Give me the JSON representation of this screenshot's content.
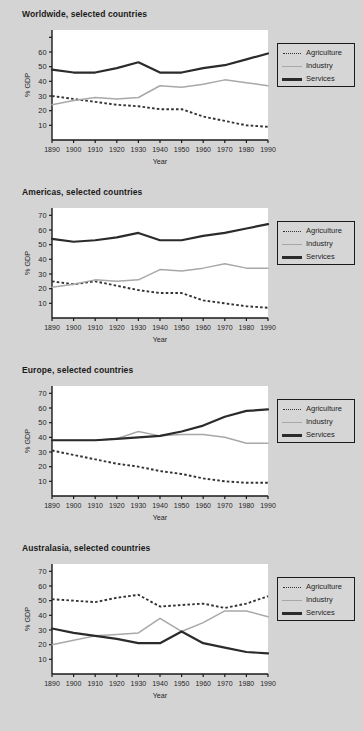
{
  "background_color": "#d4d4d4",
  "legend": {
    "items": [
      {
        "label": "Agriculture",
        "style": "dotted",
        "color": "#333333"
      },
      {
        "label": "Industry",
        "style": "thin-solid",
        "color": "#a8a8a8"
      },
      {
        "label": "Services",
        "style": "thick-solid",
        "color": "#2b2b2b"
      }
    ]
  },
  "chart_data": [
    {
      "type": "line",
      "title": "Worldwide, selected countries",
      "xlabel": "Year",
      "ylabel": "% GDP",
      "x": [
        1890,
        1900,
        1910,
        1920,
        1930,
        1940,
        1950,
        1960,
        1970,
        1980,
        1990
      ],
      "xlim": [
        1890,
        1990
      ],
      "ylim": [
        0,
        75
      ],
      "yticks": [
        10,
        20,
        30,
        40,
        50,
        60
      ],
      "ytick_labels": [
        "10",
        "20",
        "30",
        "40",
        "50",
        "60"
      ],
      "xtick_labels": [
        "1890",
        "1900",
        "1910",
        "1920",
        "1930",
        "1940",
        "1950",
        "1960",
        "1970",
        "1980",
        "1990"
      ],
      "grid": false,
      "legend_position": "right",
      "series": [
        {
          "name": "Agriculture",
          "style": "dotted",
          "color": "#333333",
          "values": [
            30,
            28,
            26,
            24,
            23,
            21,
            21,
            16,
            13,
            10,
            9
          ]
        },
        {
          "name": "Industry",
          "style": "thin-solid",
          "color": "#a8a8a8",
          "values": [
            24,
            27,
            29,
            28,
            29,
            37,
            36,
            38,
            41,
            39,
            37
          ]
        },
        {
          "name": "Services",
          "style": "thick-solid",
          "color": "#2b2b2b",
          "values": [
            48,
            46,
            46,
            49,
            53,
            46,
            46,
            49,
            51,
            55,
            59
          ]
        }
      ]
    },
    {
      "type": "line",
      "title": "Americas, selected countries",
      "xlabel": "Year",
      "ylabel": "% GDP",
      "x": [
        1890,
        1900,
        1910,
        1920,
        1930,
        1940,
        1950,
        1960,
        1970,
        1980,
        1990
      ],
      "xlim": [
        1890,
        1990
      ],
      "ylim": [
        0,
        75
      ],
      "yticks": [
        10,
        20,
        30,
        40,
        50,
        60,
        70
      ],
      "ytick_labels": [
        "10",
        "20",
        "30",
        "40",
        "50",
        "60",
        "70"
      ],
      "xtick_labels": [
        "1890",
        "1900",
        "1910",
        "1920",
        "1930",
        "1940",
        "1950",
        "1960",
        "1970",
        "1980",
        "1990"
      ],
      "grid": false,
      "legend_position": "right",
      "series": [
        {
          "name": "Agriculture",
          "style": "dotted",
          "color": "#333333",
          "values": [
            25,
            23,
            25,
            22,
            19,
            17,
            17,
            12,
            10,
            8,
            7
          ]
        },
        {
          "name": "Industry",
          "style": "thin-solid",
          "color": "#a8a8a8",
          "values": [
            21,
            23,
            26,
            25,
            26,
            33,
            32,
            34,
            37,
            34,
            34
          ]
        },
        {
          "name": "Services",
          "style": "thick-solid",
          "color": "#2b2b2b",
          "values": [
            54,
            52,
            53,
            55,
            58,
            53,
            53,
            56,
            58,
            61,
            64
          ]
        }
      ]
    },
    {
      "type": "line",
      "title": "Europe, selected countries",
      "xlabel": "Year",
      "ylabel": "% GDP",
      "x": [
        1890,
        1900,
        1910,
        1920,
        1930,
        1940,
        1950,
        1960,
        1970,
        1980,
        1990
      ],
      "xlim": [
        1890,
        1990
      ],
      "ylim": [
        0,
        75
      ],
      "yticks": [
        10,
        20,
        30,
        40,
        50,
        60,
        70
      ],
      "ytick_labels": [
        "10",
        "20",
        "30",
        "40",
        "50",
        "60",
        "70"
      ],
      "xtick_labels": [
        "1890",
        "1900",
        "1910",
        "1920",
        "1930",
        "1940",
        "1950",
        "1960",
        "1970",
        "1980",
        "1990"
      ],
      "grid": false,
      "legend_position": "right",
      "series": [
        {
          "name": "Agriculture",
          "style": "dotted",
          "color": "#333333",
          "values": [
            31,
            28,
            25,
            22,
            20,
            17,
            15,
            12,
            10,
            9,
            9
          ]
        },
        {
          "name": "Industry",
          "style": "thin-solid",
          "color": "#a8a8a8",
          "values": [
            38,
            38,
            38,
            39,
            44,
            41,
            42,
            42,
            40,
            36,
            36
          ]
        },
        {
          "name": "Services",
          "style": "thick-solid",
          "color": "#2b2b2b",
          "values": [
            38,
            38,
            38,
            39,
            40,
            41,
            44,
            48,
            54,
            58,
            59
          ]
        }
      ]
    },
    {
      "type": "line",
      "title": "Australasia, selected countries",
      "xlabel": "Year",
      "ylabel": "% GDP",
      "x": [
        1890,
        1900,
        1910,
        1920,
        1930,
        1940,
        1950,
        1960,
        1970,
        1980,
        1990
      ],
      "xlim": [
        1890,
        1990
      ],
      "ylim": [
        0,
        75
      ],
      "yticks": [
        10,
        20,
        30,
        40,
        50,
        60,
        70
      ],
      "ytick_labels": [
        "10",
        "20",
        "30",
        "40",
        "50",
        "60",
        "70"
      ],
      "xtick_labels": [
        "1890",
        "1900",
        "1910",
        "1920",
        "1930",
        "1940",
        "1950",
        "1960",
        "1970",
        "1980",
        "1990"
      ],
      "grid": false,
      "legend_position": "right",
      "series": [
        {
          "name": "Agriculture",
          "style": "dotted",
          "color": "#333333",
          "values": [
            51,
            50,
            49,
            52,
            54,
            46,
            47,
            48,
            45,
            48,
            53
          ]
        },
        {
          "name": "Industry",
          "style": "thin-solid",
          "color": "#a8a8a8",
          "values": [
            20,
            23,
            26,
            27,
            28,
            38,
            29,
            35,
            43,
            43,
            39
          ]
        },
        {
          "name": "Services",
          "style": "thick-solid",
          "color": "#2b2b2b",
          "values": [
            31,
            28,
            26,
            24,
            21,
            21,
            29,
            21,
            18,
            15,
            14
          ]
        }
      ]
    }
  ]
}
